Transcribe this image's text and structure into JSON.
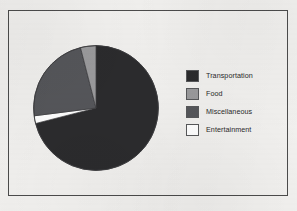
{
  "frame": {
    "border_color": "#4b4b4b",
    "background_color": "#f1f0ee"
  },
  "legend": {
    "position": "right",
    "items": [
      {
        "label": "Transportation",
        "color": "#2b2b2d",
        "swatch_name": "legend-swatch-transportation"
      },
      {
        "label": "Food",
        "color": "#9a9a9c",
        "swatch_name": "legend-swatch-food"
      },
      {
        "label": "Miscellaneous",
        "color": "#55565a",
        "swatch_name": "legend-swatch-miscellaneous"
      },
      {
        "label": "Entertainment",
        "color": "#ffffff",
        "swatch_name": "legend-swatch-entertainment"
      }
    ]
  },
  "chart_data": {
    "type": "pie",
    "title": "",
    "subtitle": "",
    "xlabel": "",
    "ylabel": "",
    "grid": false,
    "legend_position": "right",
    "start_angle_deg": 0,
    "direction": "clockwise",
    "categories": [
      "Transportation",
      "Food",
      "Miscellaneous",
      "Entertainment"
    ],
    "values": [
      71,
      4,
      23,
      2
    ],
    "unit": "percent",
    "colors": [
      "#2b2b2d",
      "#9a9a9c",
      "#55565a",
      "#ffffff"
    ],
    "slice_order_clockwise_from_top": [
      {
        "name": "Transportation",
        "value": 71,
        "start_deg": 0,
        "end_deg": 255.6,
        "color": "#2b2b2d"
      },
      {
        "name": "Entertainment",
        "value": 2,
        "start_deg": 255.6,
        "end_deg": 262.8,
        "color": "#ffffff"
      },
      {
        "name": "Miscellaneous",
        "value": 23,
        "start_deg": 262.8,
        "end_deg": 345.6,
        "color": "#55565a"
      },
      {
        "name": "Food",
        "value": 4,
        "start_deg": 345.6,
        "end_deg": 360.0,
        "color": "#9a9a9c"
      }
    ],
    "data_labels_shown": false,
    "annotations": []
  }
}
